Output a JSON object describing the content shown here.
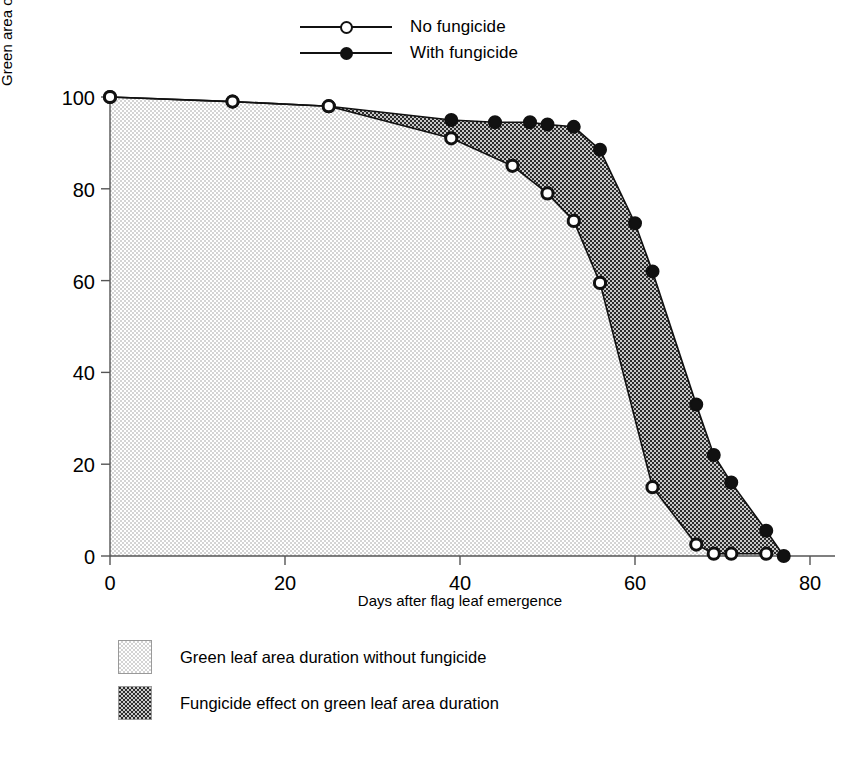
{
  "chart_data": {
    "type": "line",
    "title": "",
    "xlabel": "Days after flag leaf emergence",
    "ylabel": "Green area of the flag leaf (%)",
    "xlim": [
      0,
      80
    ],
    "ylim": [
      0,
      100
    ],
    "xticks": [
      0,
      20,
      40,
      60,
      80
    ],
    "yticks": [
      0,
      20,
      40,
      60,
      80,
      100
    ],
    "grid": false,
    "legend_position": "top-center",
    "series": [
      {
        "name": "No fungicide",
        "marker": "open-circle",
        "x": [
          0,
          14,
          25,
          39,
          46,
          50,
          53,
          56,
          62,
          67,
          69,
          71,
          75
        ],
        "y": [
          100,
          99,
          98,
          91,
          85,
          79,
          73,
          59.5,
          15,
          2.5,
          0.5,
          0.5,
          0.5
        ]
      },
      {
        "name": "With fungicide",
        "marker": "filled-circle",
        "x": [
          0,
          14,
          25,
          39,
          44,
          48,
          50,
          53,
          56,
          60,
          62,
          67,
          69,
          71,
          75,
          77
        ],
        "y": [
          100,
          99,
          98,
          95,
          94.5,
          94.5,
          94,
          93.5,
          88.5,
          72.5,
          62,
          33,
          22,
          16,
          5.5,
          0
        ]
      }
    ],
    "fills": [
      {
        "key": "light",
        "label": "Green leaf area duration without fungicide",
        "color": "#e6e6e6"
      },
      {
        "key": "dark",
        "label": "Fungicide effect on green leaf area duration",
        "color": "#6e6e6e"
      }
    ]
  },
  "legend_top": {
    "items": [
      {
        "label": "No fungicide",
        "marker": "open-circle"
      },
      {
        "label": "With fungicide",
        "marker": "filled-circle"
      }
    ]
  },
  "legend_bottom": {
    "items": [
      {
        "label": "Green leaf area duration without fungicide",
        "swatch": "light-dither"
      },
      {
        "label": "Fungicide effect on green leaf area duration",
        "swatch": "dark-dither"
      }
    ]
  },
  "axes": {
    "x_title": "Days after flag leaf emergence",
    "y_title": "Green area of the flag leaf (%)",
    "x_tick_labels": [
      "0",
      "20",
      "40",
      "60",
      "80"
    ],
    "y_tick_labels": [
      "0",
      "20",
      "40",
      "60",
      "80",
      "100"
    ]
  }
}
